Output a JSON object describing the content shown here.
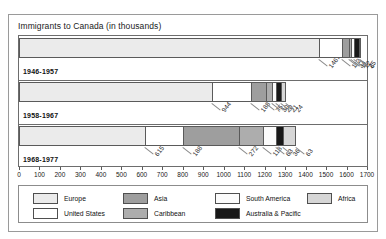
{
  "chart_data": {
    "type": "bar",
    "orientation": "horizontal",
    "stacked": true,
    "title": "Immigrants to Canada (in thousands)",
    "xlabel": "",
    "ylabel": "",
    "xlim": [
      0,
      1700
    ],
    "xticks": [
      0,
      100,
      200,
      300,
      400,
      500,
      600,
      700,
      800,
      900,
      1000,
      1100,
      1200,
      1300,
      1400,
      1500,
      1600,
      1700
    ],
    "grid": false,
    "legend_position": "bottom",
    "categories": [
      "1946-1957",
      "1958-1967",
      "1968-1977"
    ],
    "series": [
      {
        "name": "Europe",
        "color": "#ebebeb",
        "values": [
          1467,
          944,
          615
        ]
      },
      {
        "name": "United States",
        "color": "#ffffff",
        "values": [
          112,
          188,
          188
        ]
      },
      {
        "name": "Asia",
        "color": "#9e9e9e",
        "values": [
          34,
          75,
          272
        ]
      },
      {
        "name": "Caribbean",
        "color": "#adadad",
        "values": [
          11,
          30,
          118
        ]
      },
      {
        "name": "South America",
        "color": "#fbfbfb",
        "values": [
          12,
          20,
          63
        ]
      },
      {
        "name": "Australia & Pacific",
        "color": "#181818",
        "values": [
          25,
          21,
          36
        ]
      },
      {
        "name": "Africa",
        "color": "#d6d6d6",
        "values": [
          6,
          24,
          63
        ]
      }
    ],
    "bars": [
      {
        "category": "1946-1957",
        "segments": [
          {
            "name": "Europe",
            "value": 1467,
            "label": "1467"
          },
          {
            "name": "United States",
            "value": 112,
            "label": "112"
          },
          {
            "name": "Asia",
            "value": 34,
            "label": "34"
          },
          {
            "name": "Caribbean",
            "value": 11,
            "label": "11"
          },
          {
            "name": "South America",
            "value": 12,
            "label": "12"
          },
          {
            "name": "Australia & Pacific",
            "value": 25,
            "label": "25"
          },
          {
            "name": "Africa",
            "value": 6,
            "label": "6"
          }
        ]
      },
      {
        "category": "1958-1967",
        "segments": [
          {
            "name": "Europe",
            "value": 944,
            "label": "944"
          },
          {
            "name": "United States",
            "value": 188,
            "label": "188"
          },
          {
            "name": "Asia",
            "value": 75,
            "label": "75"
          },
          {
            "name": "Caribbean",
            "value": 30,
            "label": "30"
          },
          {
            "name": "South America",
            "value": 20,
            "label": "20"
          },
          {
            "name": "Australia & Pacific",
            "value": 21,
            "label": "21"
          },
          {
            "name": "Africa",
            "value": 24,
            "label": "24"
          }
        ]
      },
      {
        "category": "1968-1977",
        "segments": [
          {
            "name": "Europe",
            "value": 615,
            "label": "615"
          },
          {
            "name": "United States",
            "value": 188,
            "label": "188"
          },
          {
            "name": "Asia",
            "value": 272,
            "label": "272"
          },
          {
            "name": "Caribbean",
            "value": 118,
            "label": "118"
          },
          {
            "name": "South America",
            "value": 63,
            "label": "63"
          },
          {
            "name": "Australia & Pacific",
            "value": 36,
            "label": "36"
          },
          {
            "name": "Africa",
            "value": 63,
            "label": "63"
          }
        ]
      }
    ],
    "legend": [
      {
        "label": "Europe",
        "color": "#ebebeb"
      },
      {
        "label": "Asia",
        "color": "#9e9e9e"
      },
      {
        "label": "South America",
        "color": "#fbfbfb"
      },
      {
        "label": "Africa",
        "color": "#d6d6d6"
      },
      {
        "label": "United States",
        "color": "#ffffff"
      },
      {
        "label": "Caribbean",
        "color": "#adadad"
      },
      {
        "label": "Australia & Pacific",
        "color": "#181818"
      }
    ]
  }
}
